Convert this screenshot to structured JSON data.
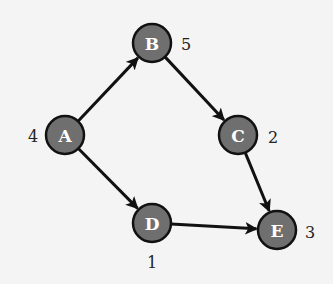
{
  "diagram": {
    "type": "directed-graph",
    "colors": {
      "background": "#f4f4f4",
      "node_fill": "#6f6f6f",
      "node_stroke": "#111111",
      "node_text": "#ffffff",
      "edge": "#111111",
      "weight_text": "#222222"
    },
    "nodes": [
      {
        "id": "A",
        "label": "A",
        "weight": "4",
        "x": 65,
        "y": 135,
        "weight_x": 33,
        "weight_y": 136
      },
      {
        "id": "B",
        "label": "B",
        "weight": "5",
        "x": 152,
        "y": 43,
        "weight_x": 186,
        "weight_y": 44
      },
      {
        "id": "C",
        "label": "C",
        "weight": "2",
        "x": 238,
        "y": 135,
        "weight_x": 273,
        "weight_y": 137
      },
      {
        "id": "D",
        "label": "D",
        "weight": "1",
        "x": 152,
        "y": 223,
        "weight_x": 152,
        "weight_y": 262
      },
      {
        "id": "E",
        "label": "E",
        "weight": "3",
        "x": 277,
        "y": 230,
        "weight_x": 310,
        "weight_y": 232
      }
    ],
    "edges": [
      {
        "from": "A",
        "to": "B"
      },
      {
        "from": "A",
        "to": "D"
      },
      {
        "from": "B",
        "to": "C"
      },
      {
        "from": "C",
        "to": "E"
      },
      {
        "from": "D",
        "to": "E"
      }
    ]
  }
}
